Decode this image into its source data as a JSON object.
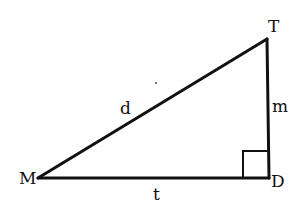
{
  "diagram": {
    "type": "right-triangle",
    "vertices": [
      {
        "id": "M",
        "label": "M",
        "x": 38,
        "y": 178
      },
      {
        "id": "D",
        "label": "D",
        "x": 269,
        "y": 178
      },
      {
        "id": "T",
        "label": "T",
        "x": 267,
        "y": 39
      }
    ],
    "sides": [
      {
        "id": "MT",
        "label": "d"
      },
      {
        "id": "TD",
        "label": "m"
      },
      {
        "id": "MD",
        "label": "t"
      }
    ],
    "right_angle_at": "D",
    "colors": {
      "stroke": "#111111",
      "background": "#ffffff"
    }
  }
}
